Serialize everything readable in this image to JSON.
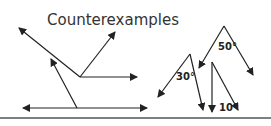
{
  "title": "Counterexamples",
  "labels": {
    "angle_50": "50°",
    "angle_30": "30°",
    "angle_10": "10°"
  },
  "colors": {
    "stroke": "#222222",
    "rule": "#555555",
    "text": "#333333"
  }
}
